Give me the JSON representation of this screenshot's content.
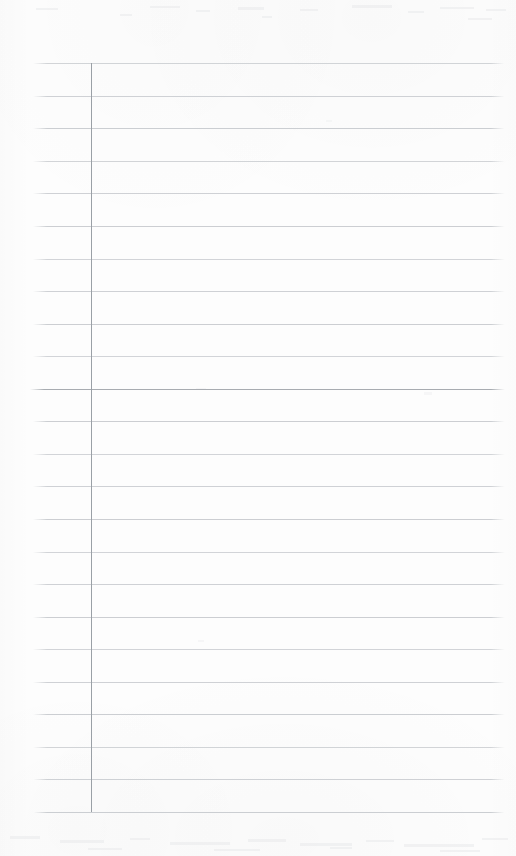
{
  "document": {
    "kind": "scanned-ruled-notepad-page",
    "title": "Lined Note Page",
    "page_width": 516,
    "page_height": 856,
    "background_color": "#fdfdfd",
    "content_text": "",
    "is_blank": "true"
  },
  "ruling": {
    "line_color": "#c9ccd0",
    "emphasis_line_color": "#a8acb1",
    "margin_line_color": "#9aa0a6",
    "line_count": 24,
    "first_line_y": 63,
    "line_spacing": 32.57,
    "line_left_x": 33,
    "line_right_x": 505,
    "emphasis_line_index": 10,
    "margin_line_x": 91,
    "margin_line_top_y": 63,
    "margin_line_bottom_y": 812,
    "lines": [
      {
        "index": 0,
        "y": 63,
        "left": 33,
        "right": 505,
        "weight": "light"
      },
      {
        "index": 1,
        "y": 96,
        "left": 33,
        "right": 505,
        "weight": "light"
      },
      {
        "index": 2,
        "y": 128,
        "left": 33,
        "right": 505,
        "weight": "light"
      },
      {
        "index": 3,
        "y": 161,
        "left": 33,
        "right": 505,
        "weight": "light"
      },
      {
        "index": 4,
        "y": 193,
        "left": 33,
        "right": 505,
        "weight": "light"
      },
      {
        "index": 5,
        "y": 226,
        "left": 33,
        "right": 505,
        "weight": "light"
      },
      {
        "index": 6,
        "y": 259,
        "left": 33,
        "right": 505,
        "weight": "light"
      },
      {
        "index": 7,
        "y": 291,
        "left": 33,
        "right": 505,
        "weight": "light"
      },
      {
        "index": 8,
        "y": 324,
        "left": 33,
        "right": 505,
        "weight": "light"
      },
      {
        "index": 9,
        "y": 356,
        "left": 33,
        "right": 505,
        "weight": "light"
      },
      {
        "index": 10,
        "y": 389,
        "left": 30,
        "right": 505,
        "weight": "emphasis"
      },
      {
        "index": 11,
        "y": 421,
        "left": 33,
        "right": 505,
        "weight": "light"
      },
      {
        "index": 12,
        "y": 454,
        "left": 33,
        "right": 505,
        "weight": "light"
      },
      {
        "index": 13,
        "y": 486,
        "left": 33,
        "right": 505,
        "weight": "light"
      },
      {
        "index": 14,
        "y": 519,
        "left": 33,
        "right": 505,
        "weight": "light"
      },
      {
        "index": 15,
        "y": 552,
        "left": 33,
        "right": 505,
        "weight": "light"
      },
      {
        "index": 16,
        "y": 584,
        "left": 33,
        "right": 505,
        "weight": "light"
      },
      {
        "index": 17,
        "y": 617,
        "left": 33,
        "right": 505,
        "weight": "light"
      },
      {
        "index": 18,
        "y": 649,
        "left": 33,
        "right": 505,
        "weight": "light"
      },
      {
        "index": 19,
        "y": 682,
        "left": 33,
        "right": 505,
        "weight": "light"
      },
      {
        "index": 20,
        "y": 714,
        "left": 33,
        "right": 505,
        "weight": "light"
      },
      {
        "index": 21,
        "y": 747,
        "left": 33,
        "right": 505,
        "weight": "light"
      },
      {
        "index": 22,
        "y": 779,
        "left": 33,
        "right": 505,
        "weight": "light"
      },
      {
        "index": 23,
        "y": 812,
        "left": 33,
        "right": 505,
        "weight": "light"
      }
    ]
  }
}
